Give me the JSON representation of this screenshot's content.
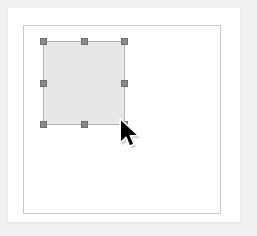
{
  "app": {
    "title": "Canvas Selection",
    "background_color": "#f1f1f1"
  },
  "panel": {
    "name": "editor-panel",
    "background_color": "#ffffff"
  },
  "canvas": {
    "name": "drawing-canvas",
    "background_color": "#ffffff",
    "border_color": "#c9c9c9"
  },
  "shape": {
    "name": "selected-rectangle",
    "type": "rectangle",
    "fill_color": "#e7e7e7",
    "stroke_color": "#b4b4b4",
    "selected": true,
    "x": 19,
    "y": 15,
    "width": 82,
    "height": 84
  },
  "selection_handles": {
    "color": "#8a8a8a",
    "border_color": "#6f6f6f",
    "size": 7,
    "items": [
      {
        "id": "nw",
        "label": "top-left"
      },
      {
        "id": "n",
        "label": "top-center"
      },
      {
        "id": "ne",
        "label": "top-right"
      },
      {
        "id": "w",
        "label": "middle-left"
      },
      {
        "id": "e",
        "label": "middle-right"
      },
      {
        "id": "sw",
        "label": "bottom-left"
      },
      {
        "id": "s",
        "label": "bottom-center"
      },
      {
        "id": "se",
        "label": "bottom-right"
      }
    ]
  },
  "cursor": {
    "name": "arrow-cursor",
    "type": "default-arrow",
    "fill_color": "#000000",
    "outline_color": "#ffffff",
    "x": 120,
    "y": 119
  }
}
